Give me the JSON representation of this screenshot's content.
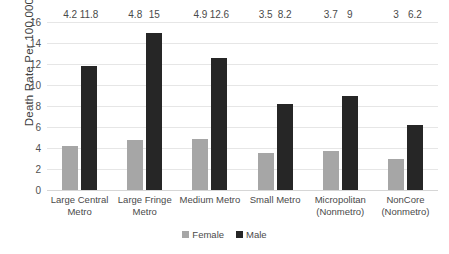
{
  "chart_data": {
    "type": "bar",
    "title": "",
    "xlabel": "",
    "ylabel": "Death Rate Per 100,000",
    "ylim": [
      0,
      16
    ],
    "ytick_step": 2,
    "yticks": [
      16,
      14,
      12,
      10,
      8,
      6,
      4,
      2,
      0
    ],
    "ytick_labels": [
      "16",
      "14",
      "12",
      "10",
      "8",
      "6",
      "4",
      "2",
      "0"
    ],
    "grid": true,
    "legend_position": "bottom",
    "categories": [
      "Large Central Metro",
      "Large Fringe Metro",
      "Medium Metro",
      "Small Metro",
      "Micropolitan (Nonmetro)",
      "NonCore (Nonmetro)"
    ],
    "category_lines": [
      [
        "Large Central",
        "Metro"
      ],
      [
        "Large Fringe",
        "Metro"
      ],
      [
        "Medium Metro"
      ],
      [
        "Small Metro"
      ],
      [
        "Micropolitan",
        "(Nonmetro)"
      ],
      [
        "NonCore",
        "(Nonmetro)"
      ]
    ],
    "series": [
      {
        "name": "Female",
        "color": "#a6a6a6",
        "values": [
          4.2,
          4.8,
          4.9,
          3.5,
          3.7,
          3
        ],
        "labels": [
          "4.2",
          "4.8",
          "4.9",
          "3.5",
          "3.7",
          "3"
        ]
      },
      {
        "name": "Male",
        "color": "#262626",
        "values": [
          11.8,
          15,
          12.6,
          8.2,
          9,
          6.2
        ],
        "labels": [
          "11.8",
          "15",
          "12.6",
          "8.2",
          "9",
          "6.2"
        ]
      }
    ]
  },
  "legend": {
    "items": [
      {
        "label": "Female",
        "color": "#a6a6a6"
      },
      {
        "label": "Male",
        "color": "#262626"
      }
    ]
  },
  "colors": {
    "background": "#ffffff",
    "gridline": "#e6e6e6",
    "axis": "#d6d6d6",
    "text": "#4a4a4a",
    "female": "#a6a6a6",
    "male": "#262626"
  }
}
